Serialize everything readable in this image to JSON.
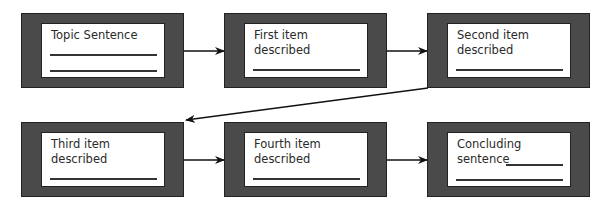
{
  "diagram": {
    "type": "flowchart",
    "boxes": [
      {
        "id": "topic",
        "label": "Topic Sentence"
      },
      {
        "id": "first",
        "label": "First item described"
      },
      {
        "id": "second",
        "label": "Second item described"
      },
      {
        "id": "third",
        "label": "Third item described"
      },
      {
        "id": "fourth",
        "label": "Fourth item described"
      },
      {
        "id": "concluding",
        "label": "Concluding sentence"
      }
    ],
    "edges": [
      {
        "from": "topic",
        "to": "first"
      },
      {
        "from": "first",
        "to": "second"
      },
      {
        "from": "second",
        "to": "third"
      },
      {
        "from": "third",
        "to": "fourth"
      },
      {
        "from": "fourth",
        "to": "concluding"
      }
    ],
    "colors": {
      "box_border": "#4a4a4a",
      "inner": "#ffffff",
      "text": "#2a2a2a"
    }
  }
}
